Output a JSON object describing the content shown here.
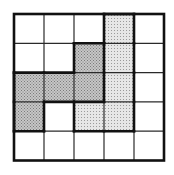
{
  "diagram": {
    "type": "grid-tiling",
    "rows": 5,
    "cols": 5,
    "origin": [
      14,
      14
    ],
    "cell_width": 30,
    "cell_height": 29.3,
    "colors": {
      "background": "#ffffff",
      "grid_line": "#2a2a2a",
      "outline": "#111111",
      "dark_fill": "#b9b9b9",
      "light_fill": "#dcdcdc"
    },
    "pieces": [
      {
        "name": "dark-piece",
        "fill": "dark",
        "cells": [
          [
            1,
            2
          ],
          [
            2,
            0
          ],
          [
            2,
            1
          ],
          [
            2,
            2
          ],
          [
            3,
            0
          ]
        ]
      },
      {
        "name": "light-piece",
        "fill": "light",
        "cells": [
          [
            0,
            3
          ],
          [
            1,
            3
          ],
          [
            2,
            3
          ],
          [
            3,
            2
          ],
          [
            3,
            3
          ]
        ]
      }
    ]
  }
}
